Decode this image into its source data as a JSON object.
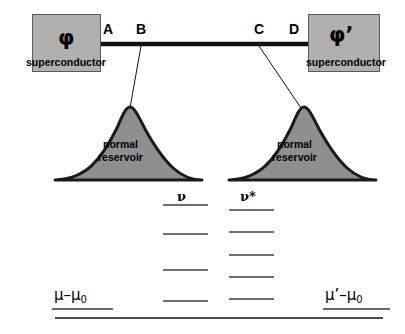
{
  "diagram": {
    "superconductors": [
      {
        "symbol": "φ",
        "caption": "superconductor",
        "side": "left"
      },
      {
        "symbol": "φ’",
        "caption": "superconductor",
        "side": "right"
      }
    ],
    "nodes": [
      {
        "label": "A",
        "x": 108
      },
      {
        "label": "B",
        "x": 141
      },
      {
        "label": "C",
        "x": 259
      },
      {
        "label": "D",
        "x": 294
      }
    ],
    "wire": {
      "y": 44,
      "x_start": 101,
      "x_end": 308,
      "thickness": 4,
      "color": "#111111"
    },
    "reservoirs": [
      {
        "caption": "normal\nreservoir",
        "side": "left",
        "peak_x": 128,
        "base_left": 55,
        "base_right": 202,
        "base_y": 180,
        "peak_y": 106
      },
      {
        "caption": "normal\nreservoir",
        "side": "right",
        "peak_x": 300,
        "base_left": 229,
        "base_right": 376,
        "base_y": 180,
        "peak_y": 106
      }
    ],
    "tethers": [
      {
        "from_node": "B",
        "x1": 141,
        "y1": 46,
        "x2": 130,
        "y2": 108
      },
      {
        "from_node": "C",
        "x1": 259,
        "y1": 46,
        "x2": 301,
        "y2": 108
      }
    ],
    "level_ladders": [
      {
        "name": "nu",
        "label": "ν",
        "x_start": 163,
        "x_end": 208,
        "levels_y": [
          205,
          234,
          270,
          301
        ]
      },
      {
        "name": "nu-star",
        "label": "ν*",
        "x_start": 229,
        "x_end": 274,
        "levels_y": [
          210,
          232,
          255,
          277,
          299
        ]
      }
    ],
    "chemical_potentials": [
      {
        "name": "mu-minus-mu0",
        "text": "μ–μ",
        "subscript": "0",
        "side": "left",
        "underline_x1": 52,
        "underline_x2": 113,
        "underline_y": 309
      },
      {
        "name": "mu-prime-minus-mu0",
        "text": "μ’–μ",
        "subscript": "0",
        "side": "right",
        "underline_x1": 323,
        "underline_x2": 390,
        "underline_y": 309
      }
    ],
    "baseline": {
      "x1": 55,
      "x2": 383,
      "y": 318
    },
    "colors": {
      "box_fill": "#b0b0b0",
      "box_stroke": "#5a5a5a",
      "reservoir_fill": "#8f8f8f",
      "reservoir_stroke": "#1a1a1a",
      "wire": "#111111",
      "level_line": "#6e6e6e",
      "baseline": "#4a4a4a",
      "text": "#000000"
    }
  }
}
